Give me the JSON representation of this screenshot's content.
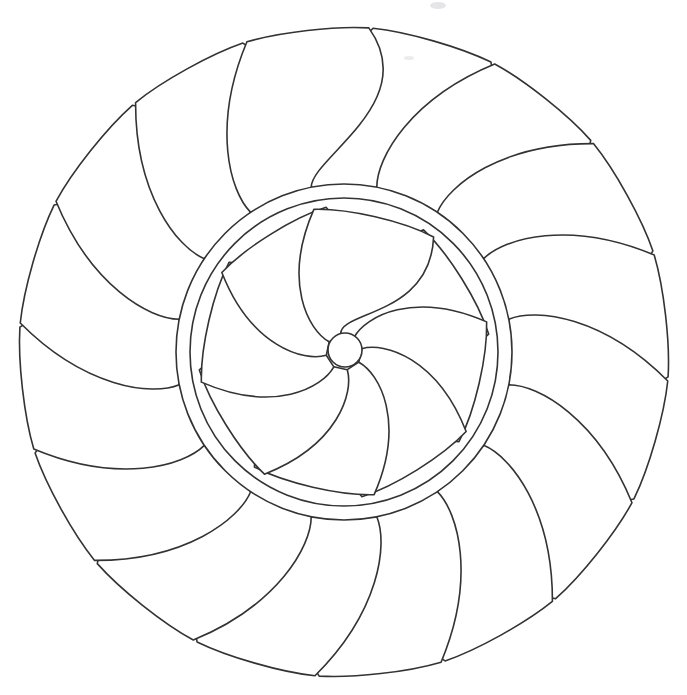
{
  "page": {
    "title": "Flower Mandala Coloring Page",
    "width": 687,
    "height": 695,
    "background_color": "#ffffff",
    "line_color": "#333333",
    "fill_color": "#ffffff",
    "stroke_width": 1.6
  },
  "artwork": {
    "name": "flower-mandala",
    "center_x": 344,
    "center_y": 352,
    "outer_petals": {
      "count": 16,
      "label": "outer petal ring",
      "inner_radius": 168,
      "tip_radius": 330,
      "half_width_deg": 11.25,
      "spiral_offset_deg": 16,
      "start_angle_deg": -90,
      "bulge": 0.62
    },
    "disc": {
      "label": "central disc",
      "outer_radius": 168,
      "inner_radius": 154
    },
    "inner_petals": {
      "count": 8,
      "label": "inner spiral petal ring",
      "hub_radius": 18,
      "tip_radius": 148,
      "half_width_deg": 22.5,
      "spiral_offset_deg": 46,
      "start_angle_deg": -78,
      "bulge": 0.78
    },
    "hub": {
      "label": "center hub circle",
      "center_x": 345,
      "center_y": 350,
      "radius": 17
    },
    "artifacts": [
      {
        "name": "scan-smudge-top",
        "x": 430,
        "y": 2,
        "w": 16,
        "h": 7
      },
      {
        "name": "scan-smudge-upper-right",
        "x": 404,
        "y": 56,
        "w": 10,
        "h": 4
      }
    ]
  },
  "chart_data": {
    "type": "pie",
    "title": "Flower Mandala Coloring Page",
    "xlabel": "",
    "ylabel": "",
    "categories": [
      "outer petals",
      "disc ring",
      "inner spiral petals",
      "center hub"
    ],
    "values": [
      16,
      1,
      8,
      1
    ],
    "legend_position": "none",
    "grid": false
  }
}
